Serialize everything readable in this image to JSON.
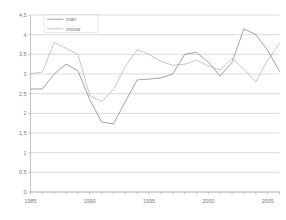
{
  "chart_data": {
    "type": "line",
    "title": "",
    "subtitle": "",
    "xlabel": "",
    "ylabel": "",
    "xlim": [
      1985,
      2006
    ],
    "ylim": [
      0,
      4.5
    ],
    "grid": true,
    "legend_position": "top-left",
    "x": [
      1985,
      1986,
      1987,
      1988,
      1989,
      1990,
      1991,
      1992,
      1993,
      1994,
      1995,
      1996,
      1997,
      1998,
      1999,
      2000,
      2001,
      2002,
      2003,
      2004,
      2005,
      2006
    ],
    "xtick_labels": [
      "1985",
      "1990",
      "1995",
      "2000",
      "2005"
    ],
    "xtick_values": [
      1985,
      1990,
      1995,
      2000,
      2005
    ],
    "ytick_labels": [
      "0",
      "0,5",
      "1",
      "1,5",
      "2",
      "2,5",
      "3",
      "3,5",
      "4",
      "4,5"
    ],
    "ytick_values": [
      0,
      0.5,
      1,
      1.5,
      2,
      2.5,
      3,
      3.5,
      4,
      4.5
    ],
    "series": [
      {
        "name": "man",
        "style": "solid",
        "color": "#8c8c8c",
        "values": [
          2.62,
          2.62,
          3.0,
          3.25,
          3.08,
          2.35,
          1.78,
          1.73,
          2.3,
          2.85,
          2.87,
          2.9,
          3.0,
          3.5,
          3.55,
          3.3,
          2.95,
          3.3,
          4.15,
          4.0,
          3.6,
          3.07
        ]
      },
      {
        "name": "vrouw",
        "style": "dotted",
        "color": "#a8a8a8",
        "values": [
          3.0,
          3.05,
          3.8,
          3.65,
          3.5,
          2.45,
          2.3,
          2.6,
          3.2,
          3.62,
          3.5,
          3.32,
          3.22,
          3.25,
          3.35,
          3.2,
          3.1,
          3.4,
          3.12,
          2.8,
          3.35,
          3.78
        ]
      }
    ]
  },
  "legend": {
    "items": [
      {
        "label": "man"
      },
      {
        "label": "vrouw"
      }
    ]
  }
}
